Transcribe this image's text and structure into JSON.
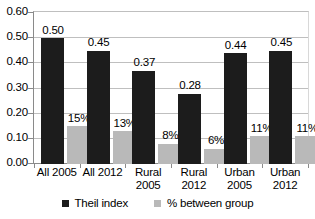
{
  "chart_data": {
    "type": "bar",
    "title": "",
    "subtitle": "",
    "xlabel": "",
    "ylabel": "",
    "ylim": [
      0.0,
      0.6
    ],
    "ytick_step": 0.1,
    "ytick_labels": [
      "0.60",
      "0.50",
      "0.40",
      "0.30",
      "0.20",
      "0.10",
      "0.00"
    ],
    "ytick_values": [
      0.6,
      0.5,
      0.4,
      0.3,
      0.2,
      0.1,
      0.0
    ],
    "grid": true,
    "legend_position": "bottom",
    "categories": [
      "All 2005",
      "All 2012",
      "Rural 2005",
      "Rural 2012",
      "Urban 2005",
      "Urban 2012"
    ],
    "category_lines": [
      [
        "All 2005"
      ],
      [
        "All 2012"
      ],
      [
        "Rural",
        "2005"
      ],
      [
        "Rural",
        "2012"
      ],
      [
        "Urban",
        "2005"
      ],
      [
        "Urban",
        "2012"
      ]
    ],
    "series": [
      {
        "name": "Theil index",
        "color": "#1c1c1c",
        "values": [
          0.5,
          0.45,
          0.37,
          0.28,
          0.44,
          0.45
        ],
        "labels": [
          "0.50",
          "0.45",
          "0.37",
          "0.28",
          "0.44",
          "0.45"
        ]
      },
      {
        "name": "% between group",
        "color": "#b9b9b9",
        "values": [
          0.15,
          0.13,
          0.08,
          0.06,
          0.11,
          0.11
        ],
        "labels": [
          "15%",
          "13%",
          "8%",
          "6%",
          "11%",
          "11%"
        ]
      }
    ]
  },
  "legend": {
    "items": [
      {
        "label": "Theil index",
        "color": "#1c1c1c"
      },
      {
        "label": "% between group",
        "color": "#b9b9b9"
      }
    ]
  },
  "colors": {
    "series_theil": "#1c1c1c",
    "series_between": "#b9b9b9",
    "gridline": "#bfbfbf",
    "axis": "#8a8a8a",
    "background": "#ffffff",
    "text": "#000000"
  }
}
